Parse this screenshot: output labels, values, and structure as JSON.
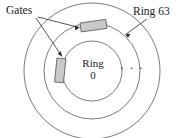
{
  "figure": {
    "name": "concentric-ring-network-diagram",
    "width": 190,
    "height": 138,
    "background": "#ffffff",
    "stroke_color": "#6b6b6b",
    "text_color": "#1a1a1a",
    "gate_fill": "#c9c9c9",
    "gate_stroke": "#555555",
    "arrow_color": "#2a2a2a"
  },
  "labels": {
    "gates": "Gates",
    "ring_outer": "Ring 63",
    "ring_inner_line1": "Ring",
    "ring_inner_line2": "0",
    "ellipsis": "· · ·"
  },
  "rings": [
    {
      "name": "ring-0-inner-circle",
      "cx": 92,
      "cy": 71,
      "r": 30
    },
    {
      "name": "ring-middle-circle",
      "cx": 92,
      "cy": 71,
      "r": 48
    },
    {
      "name": "ring-63-outer-circle",
      "cx": 92,
      "cy": 71,
      "r": 68
    }
  ],
  "gates": [
    {
      "name": "gate-top-horizontal",
      "x": 80,
      "y": 23,
      "width": 26,
      "height": 9,
      "rotation": -8
    },
    {
      "name": "gate-left-vertical",
      "x": 57,
      "y": 58,
      "width": 9,
      "height": 24,
      "rotation": 6
    }
  ],
  "annotations": [
    {
      "name": "gates-arrow-to-top-gate",
      "from": [
        38,
        17
      ],
      "to": [
        81,
        28
      ]
    },
    {
      "name": "gates-arrow-to-left-gate",
      "from": [
        36,
        18
      ],
      "to": [
        62,
        57
      ]
    },
    {
      "name": "ring63-arrow",
      "from": [
        146,
        19
      ],
      "to": [
        125,
        35
      ]
    }
  ]
}
